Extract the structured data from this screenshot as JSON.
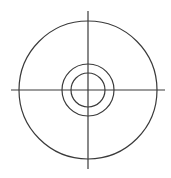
{
  "diagram": {
    "type": "concentric-circles-with-crosshair",
    "stroke_color": "#3a3a3a",
    "background": "#ffffff",
    "center": {
      "x": 88,
      "y": 90
    },
    "circles": [
      {
        "name": "outer",
        "r": 69
      },
      {
        "name": "middle",
        "r": 26
      },
      {
        "name": "inner",
        "r": 17
      }
    ],
    "crosshair": {
      "horizontal": {
        "x1": 11,
        "y": 90,
        "x2": 165
      },
      "vertical": {
        "x": 88,
        "y1": 11,
        "y2": 169
      }
    }
  }
}
